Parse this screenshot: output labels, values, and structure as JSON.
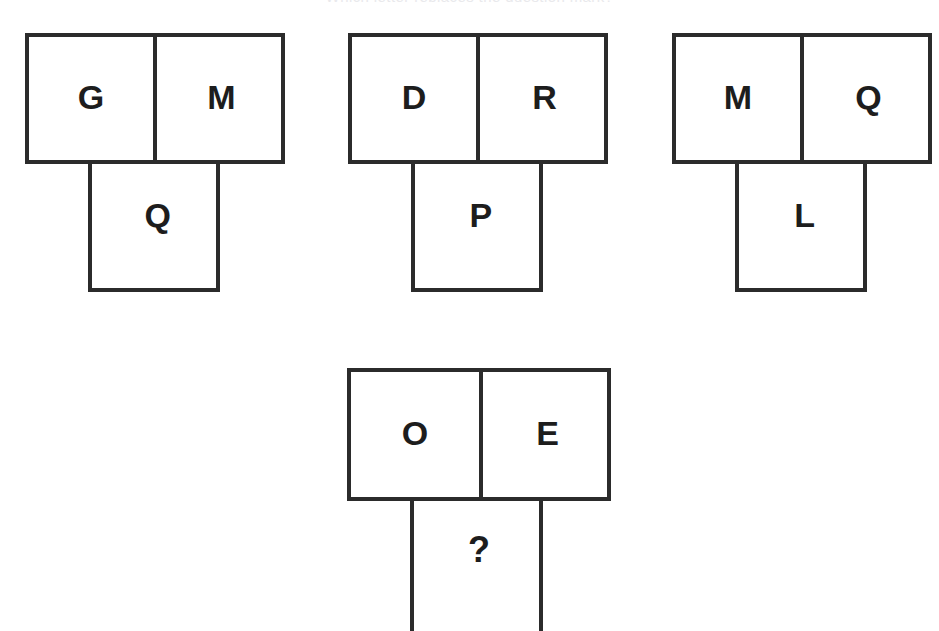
{
  "page": {
    "title_clipped": "Which letter replaces the question mark?",
    "background_color": "#ffffff",
    "line_color": "#2b2b2b",
    "text_color": "#1d1d1d"
  },
  "puzzle": {
    "type": "letter-analogy-tromino",
    "groups": [
      {
        "id": "group-1",
        "role": "example",
        "top_left": "G",
        "top_right": "M",
        "bottom": "Q"
      },
      {
        "id": "group-2",
        "role": "example",
        "top_left": "D",
        "top_right": "R",
        "bottom": "P"
      },
      {
        "id": "group-3",
        "role": "example",
        "top_left": "M",
        "top_right": "Q",
        "bottom": "L"
      },
      {
        "id": "group-4",
        "role": "question",
        "top_left": "O",
        "top_right": "E",
        "bottom": "?"
      }
    ]
  }
}
